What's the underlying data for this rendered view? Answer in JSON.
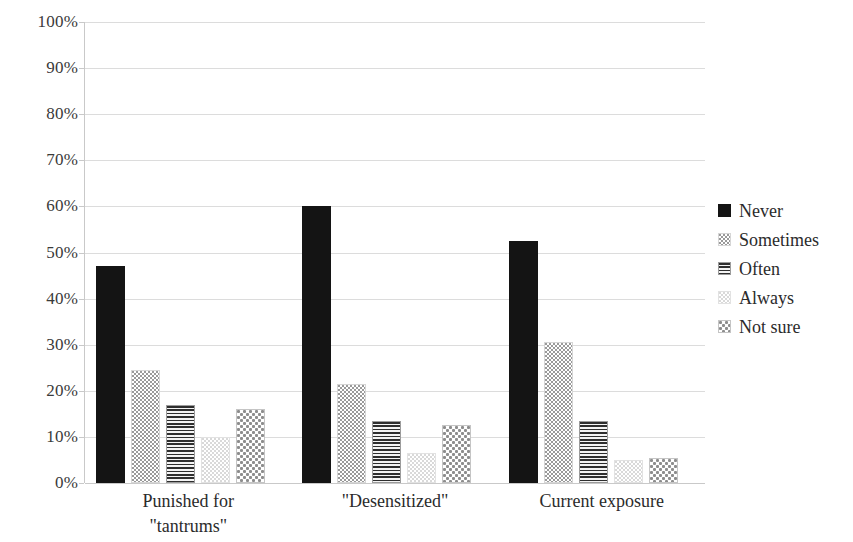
{
  "chart_data": {
    "type": "bar",
    "title": "",
    "xlabel": "",
    "ylabel": "",
    "ylim": [
      0,
      100
    ],
    "grid": true,
    "legend_position": "right",
    "value_format": "percent",
    "categories": [
      "Punished for\n\"tantrums\"",
      "\"Desensitized\"",
      "Current exposure"
    ],
    "ytick_labels": [
      "100%",
      "90%",
      "80%",
      "70%",
      "60%",
      "50%",
      "40%",
      "30%",
      "20%",
      "10%",
      "0%"
    ],
    "ytick_values": [
      100,
      90,
      80,
      70,
      60,
      50,
      40,
      30,
      20,
      10,
      0
    ],
    "series": [
      {
        "name": "Never",
        "pattern": "solid-black",
        "values": [
          47,
          60,
          52.5
        ]
      },
      {
        "name": "Sometimes",
        "pattern": "light-dots",
        "values": [
          24.5,
          21.5,
          30.5
        ]
      },
      {
        "name": "Often",
        "pattern": "horizontal-lines",
        "values": [
          17,
          13.5,
          13.5
        ]
      },
      {
        "name": "Always",
        "pattern": "very-light-dots",
        "values": [
          10,
          6.5,
          5
        ]
      },
      {
        "name": "Not sure",
        "pattern": "medium-dots",
        "values": [
          16,
          12.5,
          5.5
        ]
      }
    ]
  },
  "legend": {
    "items": [
      {
        "label": "Never"
      },
      {
        "label": "Sometimes"
      },
      {
        "label": "Often"
      },
      {
        "label": "Always"
      },
      {
        "label": "Not sure"
      }
    ]
  },
  "colors": {
    "background": "#ffffff",
    "gridline": "#dcdcdc",
    "axis": "#c9c9c9",
    "text": "#2b2b2b",
    "never": "#141414",
    "sometimes": "#9a9a9a",
    "often": "#2e2e2e",
    "always": "#d9d9d9",
    "not_sure": "#8d8d8d"
  }
}
